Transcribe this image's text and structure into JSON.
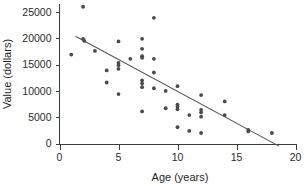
{
  "chart_data": {
    "type": "scatter",
    "title": "",
    "xlabel": "Age (years)",
    "ylabel": "Value (dollars)",
    "xlim": [
      0,
      20
    ],
    "ylim": [
      0,
      26500
    ],
    "grid": false,
    "legend": null,
    "xticks": [
      0,
      5,
      10,
      15,
      20
    ],
    "xtick_labels": [
      "0",
      "5",
      "10",
      "15",
      "20"
    ],
    "yticks": [
      0,
      5000,
      10000,
      15000,
      20000,
      25000
    ],
    "ytick_labels": [
      "0",
      "5000",
      "10000",
      "15000",
      "20000",
      "25000"
    ],
    "point_color": "#4a4a4a",
    "line_color": "#555555",
    "axis_color": "#3c3c3c",
    "background_color": "#ffffff",
    "points": [
      {
        "x": 1.0,
        "y": 16900
      },
      {
        "x": 2.0,
        "y": 26000
      },
      {
        "x": 2.0,
        "y": 19900
      },
      {
        "x": 2.1,
        "y": 19500
      },
      {
        "x": 3.0,
        "y": 17600
      },
      {
        "x": 4.0,
        "y": 13900
      },
      {
        "x": 4.0,
        "y": 11600
      },
      {
        "x": 5.0,
        "y": 19400
      },
      {
        "x": 5.0,
        "y": 15300
      },
      {
        "x": 5.0,
        "y": 14900
      },
      {
        "x": 5.0,
        "y": 14200
      },
      {
        "x": 5.0,
        "y": 9400
      },
      {
        "x": 6.0,
        "y": 16100
      },
      {
        "x": 7.0,
        "y": 19900
      },
      {
        "x": 7.0,
        "y": 18000
      },
      {
        "x": 7.0,
        "y": 16600
      },
      {
        "x": 7.0,
        "y": 16300
      },
      {
        "x": 7.0,
        "y": 12000
      },
      {
        "x": 7.0,
        "y": 11400
      },
      {
        "x": 7.0,
        "y": 10700
      },
      {
        "x": 7.0,
        "y": 6100
      },
      {
        "x": 8.0,
        "y": 23900
      },
      {
        "x": 8.0,
        "y": 16100
      },
      {
        "x": 8.0,
        "y": 13500
      },
      {
        "x": 8.0,
        "y": 10500
      },
      {
        "x": 9.0,
        "y": 10000
      },
      {
        "x": 9.0,
        "y": 6700
      },
      {
        "x": 10.0,
        "y": 10900
      },
      {
        "x": 10.0,
        "y": 7400
      },
      {
        "x": 10.0,
        "y": 7000
      },
      {
        "x": 10.0,
        "y": 6500
      },
      {
        "x": 10.0,
        "y": 3100
      },
      {
        "x": 11.0,
        "y": 5400
      },
      {
        "x": 11.0,
        "y": 2400
      },
      {
        "x": 12.0,
        "y": 9200
      },
      {
        "x": 12.0,
        "y": 6400
      },
      {
        "x": 12.0,
        "y": 5900
      },
      {
        "x": 12.0,
        "y": 5100
      },
      {
        "x": 12.0,
        "y": 2000
      },
      {
        "x": 14.0,
        "y": 8000
      },
      {
        "x": 14.0,
        "y": 5400
      },
      {
        "x": 16.0,
        "y": 2600
      },
      {
        "x": 16.0,
        "y": 2300
      },
      {
        "x": 18.0,
        "y": 2000
      }
    ],
    "trend_line": {
      "x_start": 1.35,
      "y_start": 20400,
      "x_end": 18.6,
      "y_end": -500
    }
  }
}
